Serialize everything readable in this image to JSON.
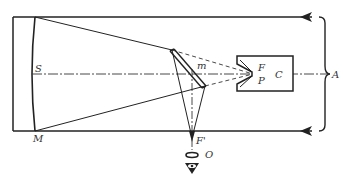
{
  "diagram": {
    "labels": {
      "S": "S",
      "M": "M",
      "m": "m",
      "F": "F",
      "P": "P",
      "C": "C",
      "A": "A",
      "F_prime": "F'",
      "O": "O"
    },
    "components": [
      {
        "id": "primary-mirror",
        "labels": [
          "S",
          "M"
        ]
      },
      {
        "id": "diagonal-mirror",
        "label": "m"
      },
      {
        "id": "focus",
        "label": "F"
      },
      {
        "id": "photographic-plate",
        "label": "P"
      },
      {
        "id": "camera-housing",
        "label": "C"
      },
      {
        "id": "incoming-light",
        "label": "A"
      },
      {
        "id": "secondary-focus",
        "label": "F'"
      },
      {
        "id": "eyepiece",
        "label": "O"
      }
    ],
    "colors": {
      "line": "#222222",
      "background": "#ffffff"
    }
  }
}
